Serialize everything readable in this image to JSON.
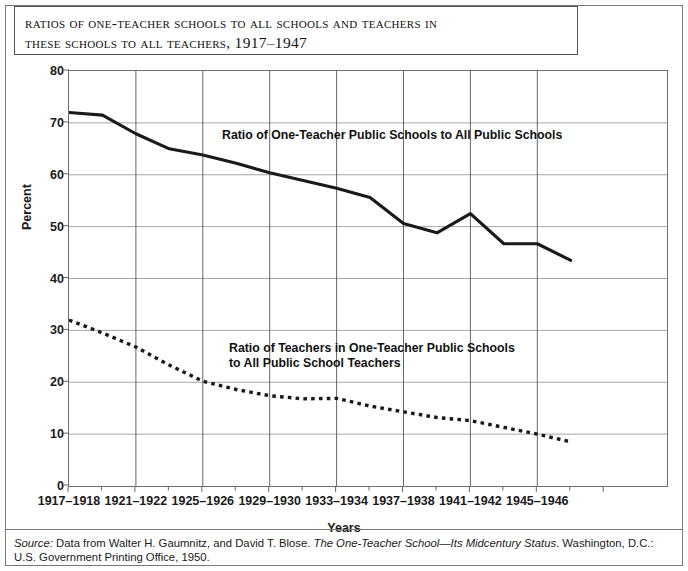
{
  "title": {
    "line1": "Ratios of One-Teacher Schools to All Schools and Teachers in",
    "line2": "These Schools to All Teachers, 1917–1947"
  },
  "source": {
    "label": "Source:",
    "text_before_italic": " Data from Walter H. Gaumnitz, and David T. Blose. ",
    "italic_title": "The One-Teacher School—Its Midcentury Status",
    "text_after_italic": ". Washington, D.C.: U.S. Government Printing Office, 1950."
  },
  "annotations": {
    "solid": "Ratio of One-Teacher Public Schools to All Public Schools",
    "dotted_line1": "Ratio of Teachers in One-Teacher Public Schools",
    "dotted_line2": "to All Public School Teachers"
  },
  "colors": {
    "line": "#1a1a1a",
    "grid": "#9a9a9a",
    "frame": "#6e6e6e",
    "background": "#ffffff"
  },
  "chart_data": {
    "type": "line",
    "title": "Ratios of One-Teacher Schools to All Schools and Teachers in These Schools to All Teachers, 1917–1947",
    "xlabel": "Years",
    "ylabel": "Percent",
    "ylim": [
      0,
      80
    ],
    "ytick_labels": [
      "0",
      "10",
      "20",
      "30",
      "40",
      "50",
      "60",
      "70",
      "80"
    ],
    "yticks": [
      0,
      10,
      20,
      30,
      40,
      50,
      60,
      70,
      80
    ],
    "xtick_labels": [
      "1917–1918",
      "1921–1922",
      "1925–1926",
      "1929–1930",
      "1933–1934",
      "1937–1938",
      "1941–1942",
      "1945–1946"
    ],
    "x_biennia": [
      "1917-1918",
      "1919-1920",
      "1921-1922",
      "1923-1924",
      "1925-1926",
      "1927-1928",
      "1929-1930",
      "1931-1932",
      "1933-1934",
      "1935-1936",
      "1937-1938",
      "1939-1940",
      "1941-1942",
      "1943-1944",
      "1945-1946",
      "1946-1947"
    ],
    "grid": true,
    "legend_position": "inline-annotation",
    "series": [
      {
        "name": "Ratio of One-Teacher Public Schools to All Public Schools",
        "style": "solid",
        "values": [
          72.0,
          71.5,
          67.9,
          65.0,
          63.8,
          62.2,
          60.4,
          58.9,
          57.4,
          55.6,
          50.6,
          48.8,
          52.5,
          46.7,
          46.7,
          43.5
        ]
      },
      {
        "name": "Ratio of Teachers in One-Teacher Public Schools to All Public School Teachers",
        "style": "dotted",
        "values": [
          32.0,
          29.5,
          26.8,
          23.3,
          20.2,
          18.6,
          17.4,
          16.8,
          16.9,
          15.4,
          14.3,
          13.2,
          12.6,
          11.3,
          10.0,
          8.5
        ]
      }
    ]
  }
}
